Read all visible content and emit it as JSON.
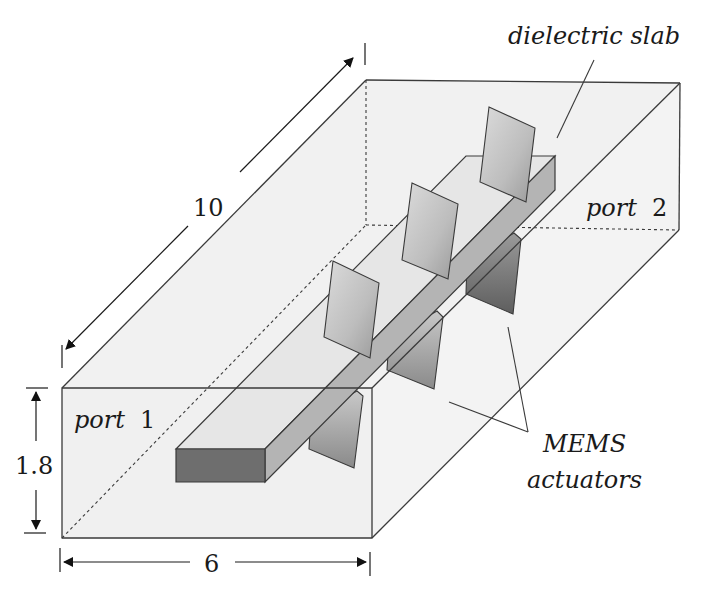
{
  "figure": {
    "labels": {
      "dielectric_slab": "dielectric slab",
      "port1_word": "port",
      "port1_num": "1",
      "port2_word": "port",
      "port2_num": "2",
      "mems_line1": "MEMS",
      "mems_line2": "actuators"
    },
    "dimensions": {
      "length": "10",
      "height": "1.8",
      "width": "6"
    },
    "colors": {
      "box_fill": "#f1f1f1",
      "slab_top": "#e6e6e6",
      "slab_side": "#b4b4b4",
      "slab_front": "#6e6e6e",
      "actuator_light": "#cfcfcf",
      "actuator_dark": "#7a7a7a",
      "edge": "#3a3a3a"
    },
    "actuator_count": 6
  }
}
